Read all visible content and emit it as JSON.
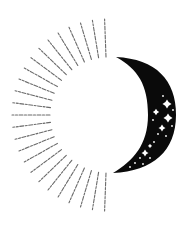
{
  "illustration": {
    "title": "Sun and crescent moon emblem",
    "icons": [
      "sun-rays-icon",
      "crescent-moon-icon",
      "sparkle-star-icon"
    ],
    "colors": {
      "background": "#ffffff",
      "moon": "#0a0a0a",
      "rays": "#6a6a6a",
      "stars": "#ffffff"
    },
    "sun": {
      "center": [
        108,
        115
      ],
      "inner_radius": 58,
      "outer_radius": 96,
      "ray_count": 25,
      "start_angle_deg": 92,
      "end_angle_deg": 268
    },
    "moon": {
      "top_tip": [
        116,
        57
      ],
      "bottom_tip": [
        113,
        173
      ],
      "outer_max_x": 176,
      "inner_max_x": 148
    },
    "stars": [
      {
        "x": 167,
        "y": 104,
        "r": 4.5
      },
      {
        "x": 156,
        "y": 112,
        "r": 3.2
      },
      {
        "x": 168,
        "y": 118,
        "r": 4.5
      },
      {
        "x": 162,
        "y": 128,
        "r": 3.5
      },
      {
        "x": 145,
        "y": 153,
        "r": 3.5
      },
      {
        "x": 150,
        "y": 146,
        "r": 2.2
      }
    ],
    "dots": [
      {
        "x": 163,
        "y": 96
      },
      {
        "x": 173,
        "y": 110
      },
      {
        "x": 153,
        "y": 120
      },
      {
        "x": 172,
        "y": 126
      },
      {
        "x": 158,
        "y": 134
      },
      {
        "x": 166,
        "y": 136
      },
      {
        "x": 140,
        "y": 158
      },
      {
        "x": 135,
        "y": 163
      },
      {
        "x": 150,
        "y": 158
      },
      {
        "x": 143,
        "y": 164
      },
      {
        "x": 130,
        "y": 167
      },
      {
        "x": 154,
        "y": 142
      }
    ]
  }
}
